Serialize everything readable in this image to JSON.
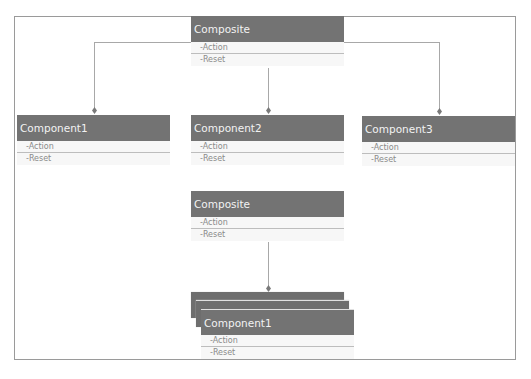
{
  "diagram": {
    "top_composite": {
      "title": "Composite",
      "members": [
        "-Action",
        "-Reset"
      ]
    },
    "components": [
      {
        "title": "Component1",
        "members": [
          "-Action",
          "-Reset"
        ]
      },
      {
        "title": "Component2",
        "members": [
          "-Action",
          "-Reset"
        ]
      },
      {
        "title": "Component3",
        "members": [
          "-Action",
          "-Reset"
        ]
      }
    ],
    "bottom_composite": {
      "title": "Composite",
      "members": [
        "-Action",
        "-Reset"
      ]
    },
    "stacked_component": {
      "title": "Component1",
      "members": [
        "-Action",
        "-Reset"
      ],
      "stack_count": 3
    },
    "colors": {
      "header": "#737373",
      "header_text": "#f2f2f2",
      "member_text": "#8a8a8a",
      "connector": "#a8a8a8"
    }
  }
}
